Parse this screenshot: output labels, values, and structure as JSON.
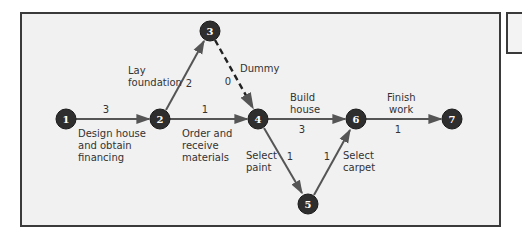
{
  "colors": {
    "frame_bg": "#f1f1f1",
    "frame_border": "#3a3a3a",
    "node_fill": "#2e2e2e",
    "node_text": "#ffffff",
    "arrow": "#555555",
    "text": "#333333"
  },
  "nodes": [
    {
      "id": "1",
      "label": "1",
      "x": 66,
      "y": 119
    },
    {
      "id": "2",
      "label": "2",
      "x": 160,
      "y": 119
    },
    {
      "id": "3",
      "label": "3",
      "x": 210,
      "y": 31
    },
    {
      "id": "4",
      "label": "4",
      "x": 258,
      "y": 119
    },
    {
      "id": "5",
      "label": "5",
      "x": 308,
      "y": 204
    },
    {
      "id": "6",
      "label": "6",
      "x": 356,
      "y": 119
    },
    {
      "id": "7",
      "label": "7",
      "x": 452,
      "y": 119
    }
  ],
  "activities": [
    {
      "from": "1",
      "to": "2",
      "duration": "3",
      "name_lines": [
        "Design house",
        "and obtain",
        "financing"
      ],
      "dashed": false
    },
    {
      "from": "2",
      "to": "3",
      "duration": "2",
      "name_lines": [
        "Lay",
        "foundation"
      ],
      "dashed": false
    },
    {
      "from": "2",
      "to": "4",
      "duration": "1",
      "name_lines": [
        "Order and",
        "receive",
        "materials"
      ],
      "dashed": false
    },
    {
      "from": "3",
      "to": "4",
      "duration": "0",
      "name_lines": [
        "Dummy"
      ],
      "dashed": true
    },
    {
      "from": "4",
      "to": "6",
      "duration": "3",
      "name_lines": [
        "Build",
        "house"
      ],
      "dashed": false
    },
    {
      "from": "4",
      "to": "5",
      "duration": "1",
      "name_lines": [
        "Select",
        "paint"
      ],
      "dashed": false
    },
    {
      "from": "5",
      "to": "6",
      "duration": "1",
      "name_lines": [
        "Select",
        "carpet"
      ],
      "dashed": false
    },
    {
      "from": "6",
      "to": "7",
      "duration": "1",
      "name_lines": [
        "Finish",
        "work"
      ],
      "dashed": false
    }
  ],
  "labels": {
    "a12": {
      "duration": "3",
      "l1": "Design house",
      "l2": "and obtain",
      "l3": "financing"
    },
    "a23": {
      "duration": "2",
      "l1": "Lay",
      "l2": "foundation"
    },
    "a24": {
      "duration": "1",
      "l1": "Order and",
      "l2": "receive",
      "l3": "materials"
    },
    "a34": {
      "duration": "0",
      "l1": "Dummy"
    },
    "a46": {
      "duration": "3",
      "l1": "Build",
      "l2": "house"
    },
    "a45": {
      "duration": "1",
      "l1": "Select",
      "l2": "paint"
    },
    "a56": {
      "duration": "1",
      "l1": "Select",
      "l2": "carpet"
    },
    "a67": {
      "duration": "1",
      "l1": "Finish",
      "l2": "work"
    }
  }
}
